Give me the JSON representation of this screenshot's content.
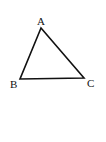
{
  "diagram": {
    "type": "triangle",
    "stroke_color": "#111111",
    "background": "#ffffff",
    "vertices": [
      {
        "label": "A",
        "x": 41,
        "y": 28
      },
      {
        "label": "B",
        "x": 20,
        "y": 79
      },
      {
        "label": "C",
        "x": 84,
        "y": 78
      }
    ],
    "labels": {
      "a": "A",
      "b": "B",
      "c": "C"
    }
  }
}
